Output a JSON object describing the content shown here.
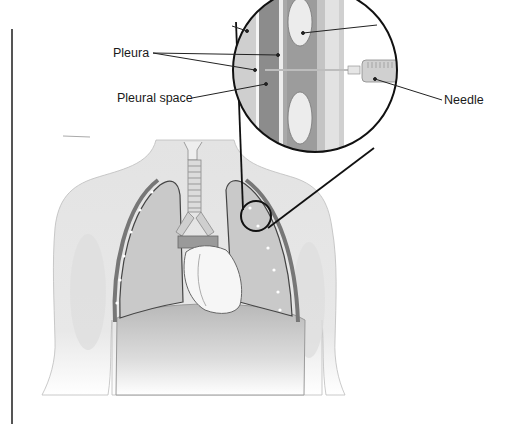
{
  "figure": {
    "labels": {
      "pleura": "Pleura",
      "pleural_space": "Pleural space",
      "needle": "Needle"
    },
    "callout": {
      "shape": "magnifier-circle",
      "source_region": "left chest wall (viewer's right), between ribs",
      "layers": [
        "skin",
        "rib",
        "parietal pleura",
        "pleural space",
        "visceral pleura",
        "lung"
      ]
    },
    "anatomy": [
      "trachea",
      "left lung",
      "right lung",
      "heart",
      "diaphragm",
      "ribs",
      "torso outline",
      "arms"
    ],
    "colors": {
      "background": "#ffffff",
      "outline": "#111111",
      "body_fill": "#e6e6e6",
      "lung_fill": "#c9c9c9",
      "dark_layer": "#8a8a8a",
      "rib_fill": "#ececec",
      "leader_line": "#222222"
    }
  }
}
